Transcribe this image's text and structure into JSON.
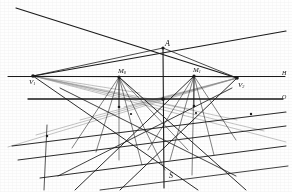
{
  "figure": {
    "caption": "",
    "background_color": "#fefefe",
    "ink_color": "#1a1a1a",
    "faint_ink_color": "#8a8a8a",
    "width": 292,
    "height": 192
  },
  "labels": {
    "apex": "A",
    "vanishing_left": "V",
    "vanishing_left_sub": "1",
    "vanishing_right": "V",
    "vanishing_right_sub": "2",
    "measuring_left": "M",
    "measuring_left_sub": "0",
    "measuring_right": "M",
    "measuring_right_sub": "1",
    "horizon_right": "H",
    "ground_right": "O",
    "station": "S"
  },
  "points": [
    {
      "name": "A",
      "x": 163,
      "y": 48,
      "label": "A",
      "sub": "",
      "label_dx": 2,
      "label_dy": -8
    },
    {
      "name": "V1",
      "x": 33,
      "y": 76,
      "label": "V",
      "sub": "1",
      "label_dx": -4,
      "label_dy": 3
    },
    {
      "name": "M0",
      "x": 119,
      "y": 77,
      "label": "M",
      "sub": "0",
      "label_dx": -1,
      "label_dy": -9
    },
    {
      "name": "M1",
      "x": 194,
      "y": 76,
      "label": "M",
      "sub": "1",
      "label_dx": -1,
      "label_dy": -9
    },
    {
      "name": "V2",
      "x": 237,
      "y": 78,
      "label": "V",
      "sub": "2",
      "label_dx": 1,
      "label_dy": 4
    },
    {
      "name": "S",
      "x": 164,
      "y": 175,
      "label": "S",
      "sub": "",
      "label_dx": 5,
      "label_dy": -3
    }
  ],
  "axis_labels": [
    {
      "name": "horizon-label",
      "text": "H",
      "x": 282,
      "y": 70
    },
    {
      "name": "ground-label",
      "text": "O",
      "x": 282,
      "y": 94
    }
  ],
  "horizontal_lines": [
    {
      "name": "horizon-line",
      "y": 76.5,
      "x1": 8,
      "x2": 285,
      "weight": 1.0
    },
    {
      "name": "ground-line",
      "y": 99.0,
      "x1": 28,
      "x2": 283,
      "weight": 1.3
    }
  ],
  "primary_lines": [
    {
      "name": "ray-upper-left-long",
      "x1": 16,
      "y1": 8,
      "x2": 237,
      "y2": 78,
      "weight": 1.2
    },
    {
      "name": "ray-upper-right-long",
      "x1": 33,
      "y1": 76,
      "x2": 286,
      "y2": 31,
      "weight": 1.2
    },
    {
      "name": "ray-apex-to-v1",
      "x1": 163,
      "y1": 48,
      "x2": 33,
      "y2": 76,
      "weight": 0.8
    },
    {
      "name": "ray-apex-to-v2",
      "x1": 163,
      "y1": 48,
      "x2": 237,
      "y2": 78,
      "weight": 0.8
    },
    {
      "name": "vertical-axis-main",
      "x1": 163,
      "y1": 48,
      "x2": 164,
      "y2": 188,
      "weight": 1.1
    }
  ],
  "fan_v1": [
    {
      "name": "v1-ray-1",
      "x2": 119,
      "y2": 77
    },
    {
      "name": "v1-ray-2",
      "x2": 140,
      "y2": 93
    },
    {
      "name": "v1-ray-3",
      "x2": 160,
      "y2": 101
    },
    {
      "name": "v1-ray-4",
      "x2": 194,
      "y2": 110
    },
    {
      "name": "v1-ray-5",
      "x2": 237,
      "y2": 120
    },
    {
      "name": "v1-ray-6",
      "x2": 264,
      "y2": 131
    },
    {
      "name": "v1-ray-7",
      "x2": 286,
      "y2": 142
    }
  ],
  "fan_v2": [
    {
      "name": "v2-ray-1",
      "x2": 194,
      "y2": 76
    },
    {
      "name": "v2-ray-2",
      "x2": 160,
      "y2": 99
    },
    {
      "name": "v2-ray-3",
      "x2": 124,
      "y2": 107
    },
    {
      "name": "v2-ray-4",
      "x2": 80,
      "y2": 120
    },
    {
      "name": "v2-ray-5",
      "x2": 36,
      "y2": 135
    },
    {
      "name": "v2-ray-6",
      "x2": 8,
      "y2": 147
    }
  ],
  "fan_m0": [
    {
      "name": "m0-ray-1",
      "x2": 72,
      "y2": 148
    },
    {
      "name": "m0-ray-2",
      "x2": 96,
      "y2": 152
    },
    {
      "name": "m0-ray-3",
      "x2": 119,
      "y2": 160
    },
    {
      "name": "m0-ray-4",
      "x2": 142,
      "y2": 165
    },
    {
      "name": "m0-ray-5",
      "x2": 165,
      "y2": 170
    },
    {
      "name": "m0-ray-6",
      "x2": 188,
      "y2": 150
    }
  ],
  "fan_m1": [
    {
      "name": "m1-ray-1",
      "x2": 148,
      "y2": 150
    },
    {
      "name": "m1-ray-2",
      "x2": 170,
      "y2": 160
    },
    {
      "name": "m1-ray-3",
      "x2": 192,
      "y2": 175
    },
    {
      "name": "m1-ray-4",
      "x2": 214,
      "y2": 155
    },
    {
      "name": "m1-ray-5",
      "x2": 236,
      "y2": 140
    }
  ],
  "secondary_lines": [
    {
      "name": "diag-a",
      "x1": 12,
      "y1": 146,
      "x2": 286,
      "y2": 112,
      "weight": 1.1
    },
    {
      "name": "diag-b",
      "x1": 18,
      "y1": 160,
      "x2": 286,
      "y2": 126,
      "weight": 1.0
    },
    {
      "name": "diag-c",
      "x1": 40,
      "y1": 178,
      "x2": 286,
      "y2": 146,
      "weight": 1.0
    },
    {
      "name": "diag-d",
      "x1": 100,
      "y1": 190,
      "x2": 288,
      "y2": 166,
      "weight": 0.9
    },
    {
      "name": "diag-e",
      "x1": 33,
      "y1": 76,
      "x2": 198,
      "y2": 190,
      "weight": 1.0
    },
    {
      "name": "diag-f",
      "x1": 237,
      "y1": 78,
      "x2": 120,
      "y2": 190,
      "weight": 1.0
    },
    {
      "name": "diag-g",
      "x1": 119,
      "y1": 77,
      "x2": 246,
      "y2": 190,
      "weight": 1.0
    },
    {
      "name": "diag-h",
      "x1": 194,
      "y1": 76,
      "x2": 75,
      "y2": 190,
      "weight": 1.0
    },
    {
      "name": "diag-i",
      "x1": 60,
      "y1": 88,
      "x2": 236,
      "y2": 176,
      "weight": 0.9
    },
    {
      "name": "diag-j",
      "x1": 232,
      "y1": 88,
      "x2": 58,
      "y2": 176,
      "weight": 0.9
    },
    {
      "name": "vert-left",
      "x1": 47,
      "y1": 125,
      "x2": 44,
      "y2": 190,
      "weight": 0.8
    },
    {
      "name": "vert-m0",
      "x1": 119,
      "y1": 77,
      "x2": 119,
      "y2": 107,
      "weight": 0.8
    },
    {
      "name": "vert-m1",
      "x1": 194,
      "y1": 76,
      "x2": 194,
      "y2": 106,
      "weight": 0.8
    }
  ],
  "nodes": [
    {
      "name": "node-apex",
      "x": 163,
      "y": 48,
      "r": 1.6
    },
    {
      "name": "node-v1",
      "x": 33,
      "y": 76,
      "r": 1.8
    },
    {
      "name": "node-m0",
      "x": 119,
      "y": 77,
      "r": 1.6
    },
    {
      "name": "node-m1",
      "x": 194,
      "y": 76,
      "r": 1.6
    },
    {
      "name": "node-v2",
      "x": 237,
      "y": 78,
      "r": 1.8
    },
    {
      "name": "node-center",
      "x": 163,
      "y": 99,
      "r": 1.8
    },
    {
      "name": "node-l1",
      "x": 119,
      "y": 107,
      "r": 1.3
    },
    {
      "name": "node-r1",
      "x": 194,
      "y": 106,
      "r": 1.3
    },
    {
      "name": "node-l2",
      "x": 47,
      "y": 136,
      "r": 1.2
    },
    {
      "name": "node-r2",
      "x": 251,
      "y": 114,
      "r": 1.2
    },
    {
      "name": "node-b1",
      "x": 131,
      "y": 114,
      "r": 1.1
    },
    {
      "name": "node-b2",
      "x": 196,
      "y": 113,
      "r": 1.1
    }
  ]
}
